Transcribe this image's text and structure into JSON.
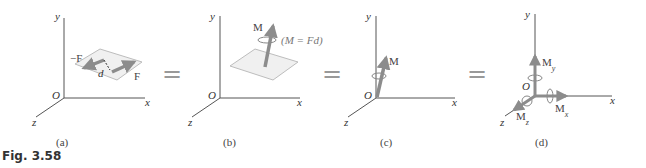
{
  "figure": {
    "caption": "Fig. 3.58",
    "colors": {
      "axis": "#555555",
      "vector": "#8c8c8c",
      "plane_fill": "#f0f0f0",
      "plane_stroke": "#bdbdbd",
      "equals": "#999999"
    },
    "panels": [
      {
        "id": "a",
        "label": "(a)",
        "axes": [
          "x",
          "y",
          "z"
        ],
        "origin": "O",
        "forces": [
          "−F",
          "F"
        ],
        "distance": "d"
      },
      {
        "id": "b",
        "label": "(b)",
        "axes": [
          "x",
          "y",
          "z"
        ],
        "origin": "O",
        "vector": "M",
        "annotation": "(M = Fd)"
      },
      {
        "id": "c",
        "label": "(c)",
        "axes": [
          "x",
          "y",
          "z"
        ],
        "origin": "O",
        "vector": "M"
      },
      {
        "id": "d",
        "label": "(d)",
        "axes": [
          "x",
          "y",
          "z"
        ],
        "origin": "O",
        "components": [
          "My",
          "Mx",
          "Mz"
        ]
      }
    ],
    "equals_sign": "="
  }
}
